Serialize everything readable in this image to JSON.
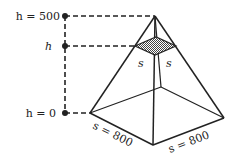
{
  "diagram": {
    "labels": {
      "top_height": "h = 500",
      "cross_height": "h",
      "base_height": "h = 0",
      "section_side_left": "s",
      "section_side_right": "s",
      "base_side_left": "s = 800",
      "base_side_right": "s = 800"
    },
    "colors": {
      "line": "#222222",
      "hatch": "#555555",
      "background": "#ffffff"
    }
  }
}
